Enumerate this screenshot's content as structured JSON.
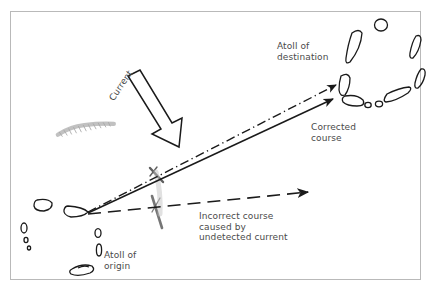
{
  "figure": {
    "frame_color": "#b9b9b9",
    "background_color": "#ffffff",
    "ink_color": "#1a1a1a",
    "label_color": "#4a4a4a",
    "smudge_color": "#9a9a9a"
  },
  "labels": {
    "atoll_of_destination": "Atoll of\ndestination",
    "atoll_of_origin": "Atoll of\norigin",
    "corrected_course": "Corrected\ncourse",
    "incorrect_course": "Incorrect course\ncaused by\nundetected current",
    "current": "Current"
  },
  "courses": [
    {
      "name": "corrected-course-track",
      "style": "dash-dot",
      "label": "Corrected course (track made good under current)",
      "from": [
        88,
        212
      ],
      "to": [
        338,
        84
      ],
      "arrowhead": "end"
    },
    {
      "name": "corrected-course-heading",
      "style": "solid",
      "label": "Corrected course",
      "from": [
        88,
        213
      ],
      "to": [
        335,
        98
      ],
      "arrowhead": "end"
    },
    {
      "name": "incorrect-course",
      "style": "dashed",
      "label": "Incorrect course caused by undetected current",
      "from": [
        88,
        214
      ],
      "to": [
        312,
        192
      ],
      "arrowhead": "end"
    }
  ],
  "current_arrow": {
    "name": "current-arrow",
    "style": "hollow-outline",
    "direction_degrees": 50,
    "from": [
      124,
      79
    ],
    "to": [
      179,
      143
    ]
  },
  "atolls": [
    {
      "name": "atoll-of-destination",
      "center": [
        370,
        65
      ],
      "islet_count": 9
    },
    {
      "name": "atoll-of-origin",
      "center": [
        70,
        230
      ],
      "islet_count": 7
    }
  ],
  "reef_smudge": {
    "name": "faint-reef-smudge",
    "center": [
      85,
      128
    ],
    "rotation_degrees": -14
  }
}
